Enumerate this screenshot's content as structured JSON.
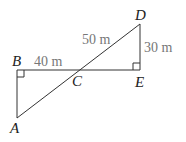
{
  "points": {
    "A": "A",
    "B": "B",
    "C": "C",
    "D": "D",
    "E": "E"
  },
  "measures": {
    "BC": "40 m",
    "CD": "50 m",
    "DE": "30 m"
  },
  "colors": {
    "line": "#333333",
    "measure": "#777777"
  }
}
